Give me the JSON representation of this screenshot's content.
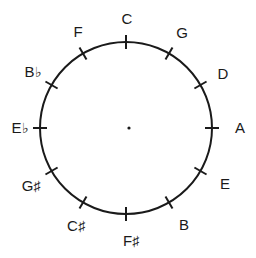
{
  "figure": {
    "background_color": "#ffffff",
    "stroke_color": "#1a1a1a"
  },
  "chart_data": {
    "type": "scatter",
    "xlabel": "",
    "ylabel": "",
    "layout": {
      "center_x": 126,
      "center_y": 128,
      "radius": 86,
      "tick_inner_radius": 79,
      "tick_outer_radius": 93,
      "grid": false,
      "legend": false,
      "center_dot_radius": 1.6,
      "circle_stroke_width": 2,
      "tick_stroke_width": 2
    },
    "categories": [
      "C",
      "G",
      "D",
      "A",
      "E",
      "B",
      "F#",
      "C#",
      "G#",
      "Eb",
      "Bb",
      "F"
    ],
    "values": [
      0,
      30,
      60,
      90,
      120,
      150,
      180,
      210,
      240,
      270,
      300,
      330
    ],
    "points": [
      {
        "label": "C",
        "letter": "C",
        "accidental": "",
        "angle_deg": 0,
        "label_x": 127,
        "label_y": 18,
        "tick_x": 129,
        "tick_y": 41
      },
      {
        "label": "G",
        "letter": "G",
        "accidental": "",
        "angle_deg": 30,
        "label_x": 182,
        "label_y": 32,
        "tick_x": 169,
        "tick_y": 53
      },
      {
        "label": "D",
        "letter": "D",
        "accidental": "",
        "angle_deg": 60,
        "label_x": 223,
        "label_y": 73,
        "tick_x": 200,
        "tick_y": 85
      },
      {
        "label": "A",
        "letter": "A",
        "accidental": "",
        "angle_deg": 90,
        "label_x": 240,
        "label_y": 127,
        "tick_x": 211,
        "tick_y": 128
      },
      {
        "label": "E",
        "letter": "E",
        "accidental": "",
        "angle_deg": 120,
        "label_x": 225,
        "label_y": 183,
        "tick_x": 200,
        "tick_y": 171
      },
      {
        "label": "B",
        "letter": "B",
        "accidental": "",
        "angle_deg": 150,
        "label_x": 184,
        "label_y": 224,
        "tick_x": 169,
        "tick_y": 203
      },
      {
        "label": "F#",
        "letter": "F",
        "accidental": "♯",
        "angle_deg": 180,
        "label_x": 131,
        "label_y": 240,
        "tick_x": 129,
        "tick_y": 215
      },
      {
        "label": "C#",
        "letter": "C",
        "accidental": "♯",
        "angle_deg": 210,
        "label_x": 76,
        "label_y": 225,
        "tick_x": 89,
        "tick_y": 203
      },
      {
        "label": "G#",
        "letter": "G",
        "accidental": "♯",
        "angle_deg": 240,
        "label_x": 31,
        "label_y": 185,
        "tick_x": 58,
        "tick_y": 171
      },
      {
        "label": "Eb",
        "letter": "E",
        "accidental": "♭",
        "angle_deg": 270,
        "label_x": 20,
        "label_y": 127,
        "tick_x": 47,
        "tick_y": 128
      },
      {
        "label": "Bb",
        "letter": "B",
        "accidental": "♭",
        "angle_deg": 300,
        "label_x": 33,
        "label_y": 71,
        "tick_x": 58,
        "tick_y": 85
      },
      {
        "label": "F",
        "letter": "F",
        "accidental": "",
        "angle_deg": 330,
        "label_x": 78,
        "label_y": 31,
        "tick_x": 89,
        "tick_y": 53
      }
    ]
  }
}
